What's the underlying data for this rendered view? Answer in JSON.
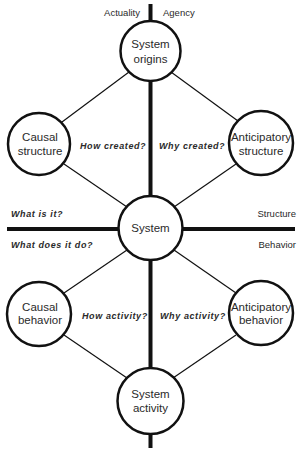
{
  "colors": {
    "ink": "#111111",
    "text": "#2a2a2a",
    "background": "#ffffff"
  },
  "axes": {
    "top_left": "Actuality",
    "top_right": "Agency",
    "right_upper": "Structure",
    "right_lower": "Behavior"
  },
  "questions": {
    "what_is_it": "What is it?",
    "what_does_it_do": "What does it do?",
    "how_created": "How created?",
    "why_created": "Why created?",
    "how_activity": "How activity?",
    "why_activity": "Why activity?"
  },
  "nodes": {
    "system_origins": {
      "line1": "System",
      "line2": "origins"
    },
    "causal_structure": {
      "line1": "Causal",
      "line2": "structure"
    },
    "anticipatory_structure": {
      "line1": "Anticipatory",
      "line2": "structure"
    },
    "system": {
      "line1": "System"
    },
    "causal_behavior": {
      "line1": "Causal",
      "line2": "behavior"
    },
    "anticipatory_behavior": {
      "line1": "Anticipatory",
      "line2": "behavior"
    },
    "system_activity": {
      "line1": "System",
      "line2": "activity"
    }
  }
}
